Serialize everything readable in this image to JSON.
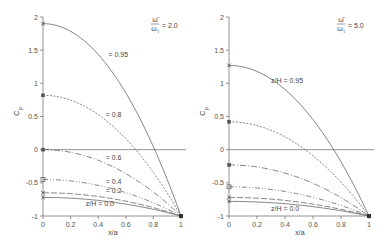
{
  "chart_data": [
    {
      "type": "line",
      "title": "",
      "annotation": "ω̄/ω_t = 2.0",
      "xlabel": "x/a",
      "ylabel": "Cp",
      "xlim": [
        0,
        1
      ],
      "ylim": [
        -1,
        2
      ],
      "xticks": [
        "0",
        "0.2",
        "0.4",
        "0.6",
        "0.8",
        "1"
      ],
      "yticks": [
        "-1",
        "-0.5",
        "0",
        "0.5",
        "1",
        "1.5",
        "2"
      ],
      "grid": false,
      "reference_line": 0,
      "series": [
        {
          "name": "z/H = 0.95",
          "label": "0.95",
          "x": [
            0,
            0.2,
            0.4,
            0.6,
            0.8,
            1
          ],
          "values": [
            1.9,
            1.79,
            1.44,
            0.86,
            0.04,
            -1.0
          ]
        },
        {
          "name": "z/H = 0.8",
          "label": "0.8",
          "x": [
            0,
            0.2,
            0.4,
            0.6,
            0.8,
            1
          ],
          "values": [
            0.82,
            0.75,
            0.53,
            0.17,
            -0.33,
            -1.0
          ]
        },
        {
          "name": "z/H = 0.6",
          "label": "0.6",
          "x": [
            0,
            0.2,
            0.4,
            0.6,
            0.8,
            1
          ],
          "values": [
            0.0,
            -0.04,
            -0.16,
            -0.36,
            -0.64,
            -1.0
          ]
        },
        {
          "name": "z/H = 0.4",
          "label": "0.4",
          "x": [
            0,
            0.2,
            0.4,
            0.6,
            0.8,
            1
          ],
          "values": [
            -0.45,
            -0.47,
            -0.54,
            -0.65,
            -0.8,
            -1.0
          ]
        },
        {
          "name": "z/H = 0.2",
          "label": "0.2",
          "x": [
            0,
            0.2,
            0.4,
            0.6,
            0.8,
            1
          ],
          "values": [
            -0.65,
            -0.66,
            -0.7,
            -0.77,
            -0.87,
            -1.0
          ]
        },
        {
          "name": "z/H = 0.0",
          "label": "z/H = 0.0",
          "x": [
            0,
            0.2,
            0.4,
            0.6,
            0.8,
            1
          ],
          "values": [
            -0.72,
            -0.73,
            -0.76,
            -0.81,
            -0.89,
            -1.0
          ]
        }
      ]
    },
    {
      "type": "line",
      "title": "",
      "annotation": "ω̄/ω_t = 5.0",
      "xlabel": "x/a",
      "ylabel": "Cp",
      "xlim": [
        0,
        1
      ],
      "ylim": [
        -1,
        2
      ],
      "xticks": [
        "0",
        "0.2",
        "0.4",
        "0.6",
        "0.8",
        "1"
      ],
      "yticks": [
        "-1",
        "-0.5",
        "0",
        "0.5",
        "1",
        "1.5",
        "2"
      ],
      "grid": false,
      "reference_line": 0,
      "series": [
        {
          "name": "z/H = 0.95",
          "label": "z/H = 0.95",
          "x": [
            0,
            0.2,
            0.4,
            0.6,
            0.8,
            1
          ],
          "values": [
            1.27,
            1.18,
            0.91,
            0.46,
            -0.18,
            -1.0
          ]
        },
        {
          "name": "z/H = 0.8",
          "label": "",
          "x": [
            0,
            0.2,
            0.4,
            0.6,
            0.8,
            1
          ],
          "values": [
            0.42,
            0.37,
            0.19,
            -0.1,
            -0.5,
            -1.0
          ]
        },
        {
          "name": "z/H = 0.6",
          "label": "",
          "x": [
            0,
            0.2,
            0.4,
            0.6,
            0.8,
            1
          ],
          "values": [
            -0.23,
            -0.26,
            -0.35,
            -0.5,
            -0.71,
            -1.0
          ]
        },
        {
          "name": "z/H = 0.4",
          "label": "",
          "x": [
            0,
            0.2,
            0.4,
            0.6,
            0.8,
            1
          ],
          "values": [
            -0.56,
            -0.58,
            -0.63,
            -0.72,
            -0.84,
            -1.0
          ]
        },
        {
          "name": "z/H = 0.2",
          "label": "",
          "x": [
            0,
            0.2,
            0.4,
            0.6,
            0.8,
            1
          ],
          "values": [
            -0.72,
            -0.73,
            -0.76,
            -0.81,
            -0.89,
            -1.0
          ]
        },
        {
          "name": "z/H = 0.0",
          "label": "z/H = 0.0",
          "x": [
            0,
            0.2,
            0.4,
            0.6,
            0.8,
            1
          ],
          "values": [
            -0.78,
            -0.79,
            -0.81,
            -0.85,
            -0.91,
            -1.0
          ]
        }
      ]
    }
  ],
  "panels": [
    {
      "annotation_num": "ω̄",
      "annotation_den": "ω",
      "annotation_sub": "t",
      "annotation_val": "= 2.0",
      "ylabel": "C",
      "ylabel_sub": "p",
      "xlabel": "x/a"
    },
    {
      "annotation_num": "ω̄",
      "annotation_den": "ω",
      "annotation_sub": "t",
      "annotation_val": "= 5.0",
      "ylabel": "C",
      "ylabel_sub": "p",
      "xlabel": "x/a"
    }
  ]
}
